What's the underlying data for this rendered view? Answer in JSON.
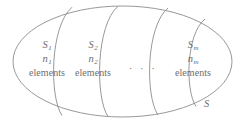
{
  "figure": {
    "name": "set-partition-diagram",
    "outer_set_label": "S",
    "stroke_color": "#8c8c8c",
    "text_color": "#6e6e6e",
    "background_color": "#ffffff"
  },
  "cells": [
    {
      "id": "cell-1",
      "set_symbol": "S",
      "set_subscript": "1",
      "count_symbol": "n",
      "count_subscript": "1",
      "unit_label": "elements"
    },
    {
      "id": "cell-2",
      "set_symbol": "S",
      "set_subscript": "2",
      "count_symbol": "n",
      "count_subscript": "2",
      "unit_label": "elements"
    },
    {
      "id": "cell-m",
      "set_symbol": "S",
      "set_subscript": "m",
      "count_symbol": "n",
      "count_subscript": "m",
      "unit_label": "elements"
    }
  ],
  "ellipsis": {
    "text": "· · ·"
  }
}
